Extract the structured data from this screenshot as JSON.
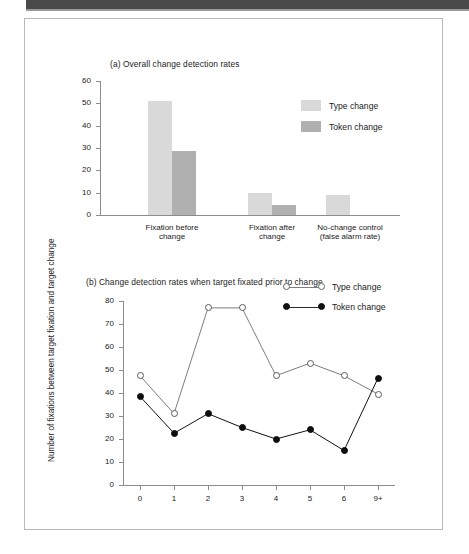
{
  "figure": {
    "panel_a": {
      "caption": "(a) Overall change detection rates",
      "legend": [
        {
          "label": "Type change",
          "color": "#d9d9d9"
        },
        {
          "label": "Token change",
          "color": "#b0b0b0"
        }
      ]
    },
    "panel_b": {
      "caption": "(b) Change detection rates when target fixated prior to change",
      "ylabel": "Number of fixations between target fixation\nand target change",
      "legend": [
        {
          "label": "Type change",
          "marker": "open-circle",
          "color": "#7d7d7d"
        },
        {
          "label": "Token change",
          "marker": "filled-circle",
          "color": "#111111"
        }
      ]
    }
  },
  "chart_data": [
    {
      "type": "bar",
      "title": "(a) Overall change detection rates",
      "xlabel": "",
      "ylabel": "",
      "ylim": [
        0,
        60
      ],
      "yticks": [
        0,
        10,
        20,
        30,
        40,
        50,
        60
      ],
      "grid": false,
      "legend_position": "upper-right",
      "categories": [
        "Fixation before\nchange",
        "Fixation after\nchange",
        "No-change control\n(false alarm rate)"
      ],
      "series": [
        {
          "name": "Type change",
          "color": "#d9d9d9",
          "values": [
            51,
            10,
            9
          ]
        },
        {
          "name": "Token change",
          "color": "#b0b0b0",
          "values": [
            28.8,
            4.5,
            null
          ]
        }
      ]
    },
    {
      "type": "line",
      "title": "(b) Change detection rates when target fixated prior to change",
      "xlabel": "",
      "ylabel": "Number of fixations between target fixation and target change",
      "ylim": [
        0,
        80
      ],
      "yticks": [
        0,
        10,
        20,
        30,
        40,
        50,
        60,
        70,
        80
      ],
      "grid": false,
      "legend_position": "upper-right",
      "x": [
        "0",
        "1",
        "2",
        "3",
        "4",
        "5",
        "6",
        "9+"
      ],
      "series": [
        {
          "name": "Type change",
          "marker": "open-circle",
          "color": "#7d7d7d",
          "values": [
            47.5,
            31,
            77,
            77,
            47.5,
            53,
            47.5,
            39.5
          ]
        },
        {
          "name": "Token change",
          "marker": "filled-circle",
          "color": "#111111",
          "values": [
            38.5,
            22.5,
            31,
            25,
            20,
            24,
            15,
            46.5
          ]
        }
      ]
    }
  ]
}
